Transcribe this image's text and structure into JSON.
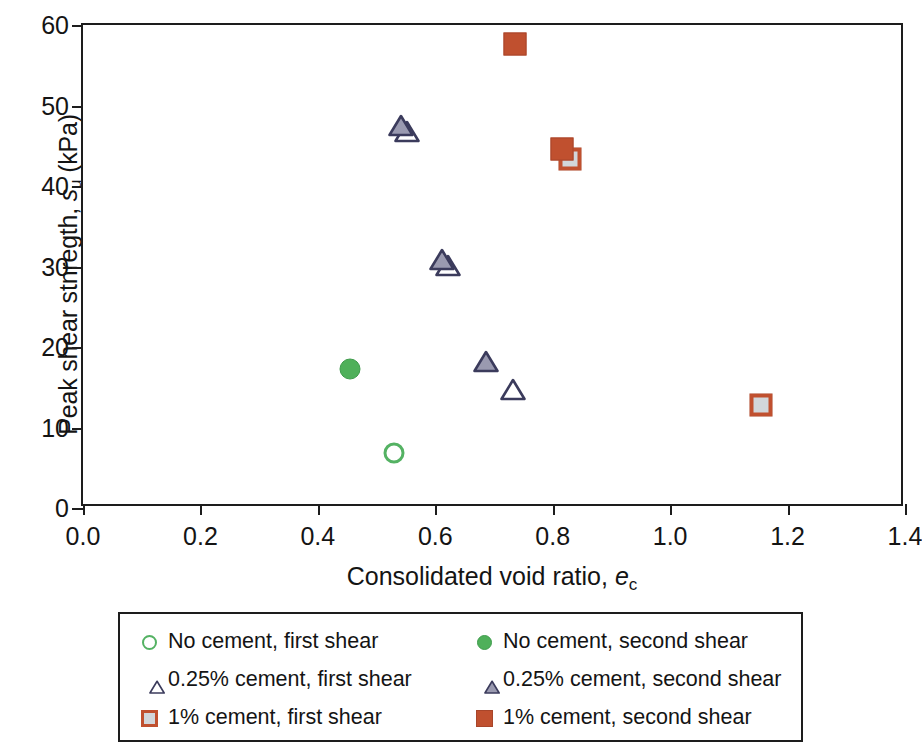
{
  "chart_data": {
    "type": "scatter",
    "title": "",
    "xlabel": "Consolidated void ratio, e_c",
    "xlabel_main": "Consolidated void ratio, ",
    "xlabel_italic": "e",
    "xlabel_sub": "c",
    "ylabel": "Peak shear stnregth, s_u (kPa)",
    "ylabel_pre": "Peak shear stnregth, ",
    "ylabel_italic": "s",
    "ylabel_sub": "u",
    "ylabel_post": " (kPa)",
    "xlim": [
      0.0,
      1.4
    ],
    "ylim": [
      0,
      60
    ],
    "xticks": [
      "0.0",
      "0.2",
      "0.4",
      "0.6",
      "0.8",
      "1.0",
      "1.2",
      "1.4"
    ],
    "xtick_values": [
      0.0,
      0.2,
      0.4,
      0.6,
      0.8,
      1.0,
      1.2,
      1.4
    ],
    "yticks": [
      "0",
      "10",
      "20",
      "30",
      "40",
      "50",
      "60"
    ],
    "ytick_values": [
      0,
      10,
      20,
      30,
      40,
      50,
      60
    ],
    "grid": false,
    "legend_position": "below-axes",
    "series": [
      {
        "name": "No cement, first shear",
        "marker": "circle-open",
        "color": "#54b263",
        "points": [
          {
            "x": 0.53,
            "y": 6.8
          }
        ]
      },
      {
        "name": "No cement, second shear",
        "marker": "circle-filled",
        "color": "#4fb05a",
        "points": [
          {
            "x": 0.455,
            "y": 17.3
          }
        ]
      },
      {
        "name": "0.25% cement, first shear",
        "marker": "triangle-open",
        "color": "#3b3b5c",
        "points": [
          {
            "x": 0.53,
            "y": 48.2
          },
          {
            "x": 0.6,
            "y": 31.5
          },
          {
            "x": 0.71,
            "y": 16.2
          }
        ]
      },
      {
        "name": "0.25% cement, second shear",
        "marker": "triangle-filled",
        "color": "#9a9ab0",
        "points": [
          {
            "x": 0.52,
            "y": 49.0
          },
          {
            "x": 0.59,
            "y": 32.3
          },
          {
            "x": 0.665,
            "y": 19.6
          }
        ]
      },
      {
        "name": "1% cement, first shear",
        "marker": "square-hatched",
        "color": "#c0502f",
        "points": [
          {
            "x": 0.83,
            "y": 43.3
          },
          {
            "x": 1.155,
            "y": 12.8
          }
        ]
      },
      {
        "name": "1% cement, second shear",
        "marker": "square-filled",
        "color": "#c0502f",
        "points": [
          {
            "x": 0.735,
            "y": 57.7
          },
          {
            "x": 0.815,
            "y": 44.6
          }
        ]
      }
    ]
  },
  "legend": {
    "entries": [
      {
        "label": "No cement, first shear",
        "marker": "circle-open"
      },
      {
        "label": "No cement, second shear",
        "marker": "circle-filled"
      },
      {
        "label": "0.25% cement, first shear",
        "marker": "triangle-open"
      },
      {
        "label": "0.25% cement, second shear",
        "marker": "triangle-filled"
      },
      {
        "label": "1% cement, first shear",
        "marker": "square-hatched"
      },
      {
        "label": "1% cement, second shear",
        "marker": "square-filled"
      }
    ]
  },
  "colors": {
    "green": "#4fb05a",
    "green_outline": "#54b263",
    "navy": "#3b3b5c",
    "slate": "#9a9ab0",
    "rust": "#c0502f",
    "axis": "#1d1d1d"
  }
}
